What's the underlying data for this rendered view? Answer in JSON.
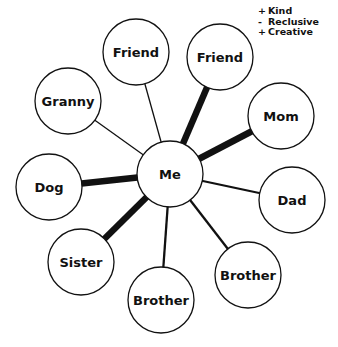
{
  "center": {
    "id": "me",
    "label": "Me",
    "x": 170,
    "y": 174,
    "r": 33
  },
  "nodes": [
    {
      "id": "friend1",
      "label": "Friend",
      "x": 136,
      "y": 52,
      "r": 33,
      "strength": "weak"
    },
    {
      "id": "friend2",
      "label": "Friend",
      "x": 220,
      "y": 57,
      "r": 33,
      "strength": "strong"
    },
    {
      "id": "granny",
      "label": "Granny",
      "x": 68,
      "y": 101,
      "r": 33,
      "strength": "weak"
    },
    {
      "id": "mom",
      "label": "Mom",
      "x": 281,
      "y": 116,
      "r": 33,
      "strength": "strong"
    },
    {
      "id": "dog",
      "label": "Dog",
      "x": 49,
      "y": 187,
      "r": 33,
      "strength": "strong"
    },
    {
      "id": "dad",
      "label": "Dad",
      "x": 292,
      "y": 200,
      "r": 33,
      "strength": "medium"
    },
    {
      "id": "sister",
      "label": "Sister",
      "x": 81,
      "y": 262,
      "r": 33,
      "strength": "strong"
    },
    {
      "id": "brother1",
      "label": "Brother",
      "x": 161,
      "y": 300,
      "r": 33,
      "strength": "medium"
    },
    {
      "id": "brother2",
      "label": "Brother",
      "x": 248,
      "y": 275,
      "r": 33,
      "strength": "medium"
    }
  ],
  "strength_widths": {
    "weak": 1.3,
    "medium": 2.3,
    "strong": 6.5
  },
  "annotation": {
    "attached_to": "friend2",
    "x": 258,
    "y": 14,
    "items": [
      {
        "sign": "+",
        "text": "Kind"
      },
      {
        "sign": "-",
        "text": "Reclusive"
      },
      {
        "sign": "+",
        "text": "Creative"
      }
    ]
  },
  "colors": {
    "stroke": "#111111",
    "fill": "#ffffff",
    "text": "#111111"
  }
}
